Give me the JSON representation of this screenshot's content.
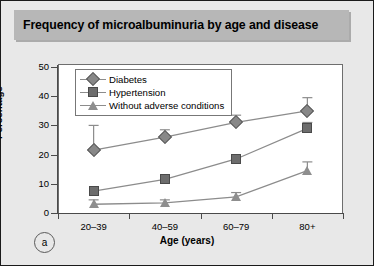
{
  "figure": {
    "title": "Frequency of microalbuminuria by age and disease",
    "panel_label": "a",
    "background_color": "#e8e8e8",
    "title_band_color": "#b7b7b7",
    "plot_background": "#ffffff"
  },
  "chart_data": {
    "type": "line",
    "title": "Frequency of microalbuminuria by age and disease",
    "xlabel": "Age (years)",
    "ylabel": "Percentage",
    "categories": [
      "20–39",
      "40–59",
      "60–79",
      "80+"
    ],
    "ylim": [
      0,
      50
    ],
    "yticks": [
      0,
      10,
      20,
      30,
      40,
      50
    ],
    "ytick_labels": [
      "0",
      "10",
      "20",
      "30",
      "40",
      "50"
    ],
    "grid": false,
    "legend_position": "top-left-inside",
    "series": [
      {
        "name": "Diabetes",
        "marker": "diamond",
        "color": "#888888",
        "values": [
          21.5,
          26.0,
          31.0,
          35.0
        ],
        "err_low": [
          21.5,
          26.0,
          31.0,
          35.0
        ],
        "err_high": [
          30.0,
          28.5,
          33.5,
          39.5
        ]
      },
      {
        "name": "Hypertension",
        "marker": "square",
        "color": "#6d6d6d",
        "values": [
          7.5,
          11.5,
          18.5,
          29.0
        ],
        "err_low": [
          7.5,
          11.5,
          18.5,
          29.0
        ],
        "err_high": [
          7.5,
          11.5,
          18.5,
          31.0
        ]
      },
      {
        "name": "Without adverse conditions",
        "marker": "triangle",
        "color": "#8e8e8e",
        "values": [
          3.0,
          3.5,
          5.5,
          14.5
        ],
        "err_low": [
          3.0,
          3.5,
          5.5,
          14.5
        ],
        "err_high": [
          4.5,
          4.5,
          7.0,
          17.5
        ]
      }
    ]
  },
  "legend": {
    "items": [
      {
        "label": "Diabetes",
        "marker": "diamond"
      },
      {
        "label": "Hypertension",
        "marker": "square"
      },
      {
        "label": "Without adverse conditions",
        "marker": "triangle"
      }
    ]
  }
}
